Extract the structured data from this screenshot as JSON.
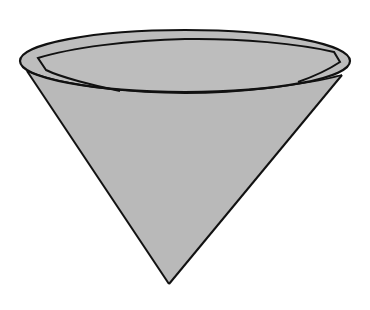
{
  "figure": {
    "colors": {
      "background": "#ffffff",
      "fill": "#b9b9b9",
      "stroke": "#111111"
    },
    "geometry": {
      "rim_ellipse": {
        "cx": 185,
        "cy": 61,
        "rx": 165,
        "ry": 31
      },
      "apex": {
        "x": 169,
        "y": 284
      },
      "left_edge_top": {
        "x": 27,
        "y": 71
      },
      "right_edge_top": {
        "x": 342,
        "y": 75
      }
    }
  }
}
